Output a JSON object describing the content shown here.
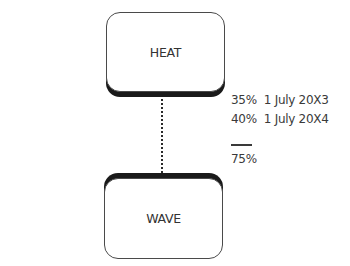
{
  "diagram": {
    "nodes": [
      {
        "id": "heat",
        "label": "HEAT"
      },
      {
        "id": "wave",
        "label": "WAVE"
      }
    ],
    "edge": {
      "from": "heat",
      "to": "wave",
      "style": "dotted"
    },
    "annotations": [
      {
        "percent": "35%",
        "date": "1 July 20X3",
        "text": "35%  1 July 20X3"
      },
      {
        "percent": "40%",
        "date": "1 July 20X4",
        "text": "40%  1 July 20X4"
      }
    ],
    "total": {
      "percent": "75%",
      "text": "75%"
    },
    "colors": {
      "border": "#4a4a4a",
      "shadow": "#1a1a1a",
      "text": "#3a3a3a"
    }
  }
}
